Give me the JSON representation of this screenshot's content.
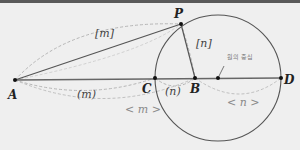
{
  "diagram": {
    "points": {
      "A": {
        "label": "A",
        "x": 15,
        "y": 80
      },
      "P": {
        "label": "P",
        "x": 181,
        "y": 24
      },
      "C": {
        "label": "C",
        "x": 155,
        "y": 78
      },
      "B": {
        "label": "B",
        "x": 195,
        "y": 78
      },
      "O": {
        "label": "",
        "x": 218,
        "y": 78
      },
      "D": {
        "label": "D",
        "x": 281,
        "y": 78
      }
    },
    "circle": {
      "cx": 218,
      "cy": 78,
      "r": 63
    },
    "annotations": {
      "AP_length": "[m]",
      "PB_length": "[n]",
      "AC_length": "(m)",
      "CB_length": "(n)",
      "AB_length": "< m >",
      "BD_length": "< n >",
      "center_label": "원의 중심"
    },
    "colors": {
      "line": "#555555",
      "dashed": "#b0b0b0",
      "background": "#efefef"
    }
  }
}
